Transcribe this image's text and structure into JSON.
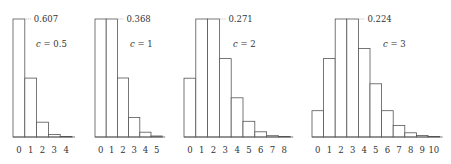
{
  "chart_data": [
    {
      "type": "bar",
      "title": "",
      "label": "c = 0.5",
      "param_symbol": "c",
      "param_value": "0.5",
      "peak_label": "0.607",
      "categories": [
        "0",
        "1",
        "2",
        "3",
        "4"
      ],
      "values": [
        0.607,
        0.303,
        0.076,
        0.013,
        0.002
      ],
      "xlabel": "",
      "ylabel": "",
      "ylim": [
        0,
        0.607
      ],
      "grid": false
    },
    {
      "type": "bar",
      "title": "",
      "label": "c = 1",
      "param_symbol": "c",
      "param_value": "1",
      "peak_label": "0.368",
      "categories": [
        "0",
        "1",
        "2",
        "3",
        "4",
        "5"
      ],
      "values": [
        0.368,
        0.368,
        0.184,
        0.061,
        0.015,
        0.003
      ],
      "xlabel": "",
      "ylabel": "",
      "ylim": [
        0,
        0.368
      ],
      "grid": false
    },
    {
      "type": "bar",
      "title": "",
      "label": "c = 2",
      "param_symbol": "c",
      "param_value": "2",
      "peak_label": "0.271",
      "categories": [
        "0",
        "1",
        "2",
        "3",
        "4",
        "5",
        "6",
        "7",
        "8"
      ],
      "values": [
        0.135,
        0.271,
        0.271,
        0.18,
        0.09,
        0.036,
        0.012,
        0.003,
        0.001
      ],
      "xlabel": "",
      "ylabel": "",
      "ylim": [
        0,
        0.271
      ],
      "grid": false
    },
    {
      "type": "bar",
      "title": "",
      "label": "c = 3",
      "param_symbol": "c",
      "param_value": "3",
      "peak_label": "0.224",
      "categories": [
        "0",
        "1",
        "2",
        "3",
        "4",
        "5",
        "6",
        "7",
        "8",
        "9",
        "10"
      ],
      "values": [
        0.05,
        0.149,
        0.224,
        0.224,
        0.168,
        0.101,
        0.05,
        0.022,
        0.008,
        0.003,
        0.001
      ],
      "xlabel": "",
      "ylabel": "",
      "ylim": [
        0,
        0.224
      ],
      "grid": false
    }
  ],
  "layout": {
    "panels": [
      {
        "x0": 13,
        "bar_w": 11.8,
        "label_x": 36,
        "label_y": 47
      },
      {
        "x0": 95,
        "bar_w": 11.2,
        "label_x": 130,
        "label_y": 47
      },
      {
        "x0": 184,
        "bar_w": 11.8,
        "label_x": 233,
        "label_y": 47
      },
      {
        "x0": 312,
        "bar_w": 11.6,
        "label_x": 383,
        "label_y": 47
      }
    ],
    "baseline_y": 137,
    "top_y": 19,
    "tick_label_y": 153,
    "colors": {
      "bar_stroke": "#555555",
      "bar_fill": "#ffffff",
      "leader": "#999999",
      "text": "#333333"
    }
  }
}
